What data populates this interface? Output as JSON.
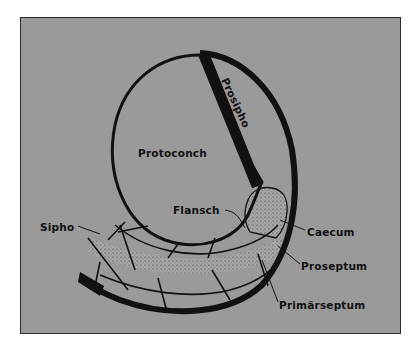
{
  "diagram": {
    "background_color": "#9a9a9a",
    "line_color": "#111111",
    "labels": {
      "prosipho": "Prosipho",
      "protoconch": "Protoconch",
      "flansch": "Flansch",
      "sipho": "Sipho",
      "caecum": "Caecum",
      "proseptum": "Proseptum",
      "primarseptum": "Primärseptum"
    }
  }
}
